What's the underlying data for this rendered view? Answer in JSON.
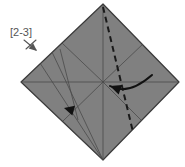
{
  "figure": {
    "kind": "origami-fold-diagram",
    "canvas": {
      "width": 185,
      "height": 167
    },
    "background_color": "#ffffff"
  },
  "paper": {
    "name": "square-sheet-diamond",
    "fill_color": "#808080",
    "edge_color": "#3a3a3a",
    "edge_width": 1.2,
    "vertices": {
      "top": {
        "x": 103,
        "y": 4
      },
      "right": {
        "x": 179,
        "y": 82
      },
      "bottom": {
        "x": 103,
        "y": 160
      },
      "left": {
        "x": 21,
        "y": 82
      }
    },
    "center": {
      "x": 103,
      "y": 82
    }
  },
  "creases": {
    "color": "#4a4a4a",
    "width": 0.8,
    "lines": [
      {
        "name": "horizontal-diagonal",
        "x1": 21,
        "y1": 82,
        "x2": 179,
        "y2": 82
      },
      {
        "name": "vertical-diagonal",
        "x1": 103,
        "y1": 4,
        "x2": 103,
        "y2": 160
      },
      {
        "name": "crease-upper-left-to-center",
        "x1": 62,
        "y1": 43,
        "x2": 103,
        "y2": 82
      },
      {
        "name": "crease-center-to-lower-right",
        "x1": 103,
        "y1": 82,
        "x2": 142,
        "y2": 121
      },
      {
        "name": "crease-upper-right-to-center",
        "x1": 144,
        "y1": 43,
        "x2": 103,
        "y2": 82
      },
      {
        "name": "crease-center-to-lower-left",
        "x1": 103,
        "y1": 82,
        "x2": 63,
        "y2": 121
      },
      {
        "name": "crease-fan-left-outer",
        "x1": 40,
        "y1": 63,
        "x2": 103,
        "y2": 160
      },
      {
        "name": "crease-fan-left-inner",
        "x1": 52,
        "y1": 52,
        "x2": 103,
        "y2": 160
      },
      {
        "name": "crease-fan-left-short",
        "x1": 33,
        "y1": 94,
        "x2": 103,
        "y2": 160
      },
      {
        "name": "crease-bottom-left-edge-inner",
        "x1": 60,
        "y1": 49,
        "x2": 78,
        "y2": 120
      }
    ]
  },
  "fold_line": {
    "name": "valley-fold-dashed",
    "style": "dashed",
    "color": "#1a1a1a",
    "width": 2,
    "dash_pattern": "6,4",
    "x1": 103,
    "y1": 7,
    "x2": 133,
    "y2": 132
  },
  "arrows": [
    {
      "name": "fold-arrow-curved-left",
      "type": "curved",
      "color": "#111111",
      "description": "curved arrow sweeping right to left indicating the fold direction",
      "start": {
        "x": 152,
        "y": 75
      },
      "control": {
        "x": 128,
        "y": 96
      },
      "end": {
        "x": 110,
        "y": 86
      },
      "head_angle_deg": 200
    },
    {
      "name": "crease-indicator-arrowhead",
      "type": "arrowhead-only",
      "color": "#111111",
      "description": "small arrowhead on lower-left crease pointing left",
      "tip": {
        "x": 64,
        "y": 108
      },
      "head_angle_deg": 195
    },
    {
      "name": "step-reference-arrow",
      "type": "straight",
      "color": "#555555",
      "description": "thin arrow below the step label pointing down-right toward the model",
      "start": {
        "x": 24,
        "y": 40
      },
      "end": {
        "x": 36,
        "y": 50
      }
    },
    {
      "name": "step-reference-cross-stroke",
      "type": "straight",
      "color": "#555555",
      "description": "second stroke forming an X with the reference arrow",
      "start": {
        "x": 36,
        "y": 40
      },
      "end": {
        "x": 26,
        "y": 49
      }
    }
  ],
  "labels": {
    "step_reference": {
      "name": "step-range-label",
      "text": "[2-3]",
      "x": 10,
      "y": 36,
      "color": "#555555",
      "font_size_px": 11
    }
  }
}
